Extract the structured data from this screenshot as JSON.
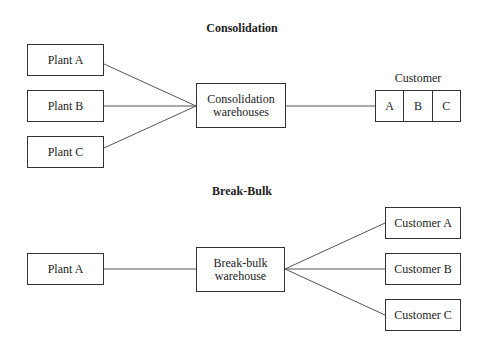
{
  "consolidation": {
    "title": "Consolidation",
    "plants": [
      "Plant A",
      "Plant B",
      "Plant C"
    ],
    "warehouse": [
      "Consolidation",
      "warehouses"
    ],
    "customer_label": "Customer",
    "customer_cells": [
      "A",
      "B",
      "C"
    ]
  },
  "break_bulk": {
    "title": "Break-Bulk",
    "plant": "Plant A",
    "warehouse": [
      "Break-bulk",
      "warehouse"
    ],
    "customers": [
      "Customer A",
      "Customer B",
      "Customer C"
    ]
  }
}
